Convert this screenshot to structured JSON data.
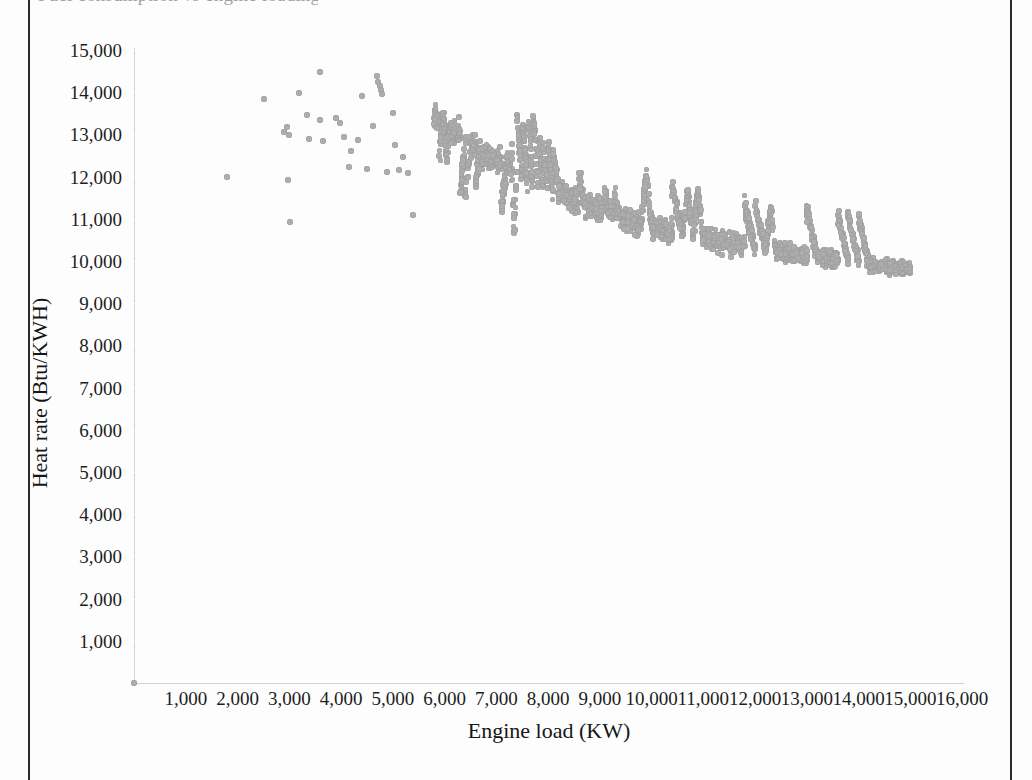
{
  "page": {
    "title_remnant": "Fuel consumption vs engine loading",
    "frame_color": "#2b2b2b",
    "background": "#ffffff"
  },
  "chart_data": {
    "type": "scatter",
    "title": "",
    "xlabel": "Engine load (KW)",
    "ylabel": "Heat rate (Btu/KWH)",
    "xlim": [
      0,
      16000
    ],
    "ylim": [
      0,
      15000
    ],
    "xticks": [
      "1,000",
      "2,000",
      "3,000",
      "4,000",
      "5,000",
      "6,000",
      "7,000",
      "8,000",
      "9,000",
      "10,000",
      "11,000",
      "12,000",
      "13,000",
      "14,000",
      "15,000",
      "16,000"
    ],
    "xtick_values": [
      1000,
      2000,
      3000,
      4000,
      5000,
      6000,
      7000,
      8000,
      9000,
      10000,
      11000,
      12000,
      13000,
      14000,
      15000,
      16000
    ],
    "yticks": [
      "1,000",
      "2,000",
      "3,000",
      "4,000",
      "5,000",
      "6,000",
      "7,000",
      "8,000",
      "9,000",
      "10,000",
      "11,000",
      "12,000",
      "13,000",
      "14,000",
      "15,000"
    ],
    "ytick_values": [
      1000,
      2000,
      3000,
      4000,
      5000,
      6000,
      7000,
      8000,
      9000,
      10000,
      11000,
      12000,
      13000,
      14000,
      15000
    ],
    "grid": "faint",
    "legend": "none",
    "marker_color": "#adadad",
    "marker_shape": "circle",
    "series": [
      {
        "name": "Engine operating points",
        "points": [
          [
            0,
            0
          ],
          [
            1800,
            11980
          ],
          [
            2520,
            13830
          ],
          [
            2900,
            13060
          ],
          [
            3000,
            12980
          ],
          [
            2960,
            13180
          ],
          [
            2980,
            11930
          ],
          [
            3020,
            10930
          ],
          [
            3180,
            13970
          ],
          [
            3350,
            13460
          ],
          [
            3380,
            12900
          ],
          [
            3600,
            14470
          ],
          [
            3600,
            13330
          ],
          [
            3650,
            12850
          ],
          [
            3900,
            13400
          ],
          [
            3980,
            13260
          ],
          [
            4050,
            12950
          ],
          [
            4150,
            12220
          ],
          [
            4200,
            12600
          ],
          [
            4320,
            12870
          ],
          [
            4400,
            13900
          ],
          [
            4500,
            12180
          ],
          [
            4620,
            13200
          ],
          [
            4700,
            14380
          ],
          [
            4720,
            14230
          ],
          [
            4760,
            14150
          ],
          [
            4780,
            14060
          ],
          [
            4800,
            13950
          ],
          [
            4880,
            12120
          ],
          [
            5000,
            13500
          ],
          [
            5050,
            12740
          ],
          [
            5120,
            12150
          ],
          [
            5300,
            12080
          ],
          [
            5400,
            11100
          ],
          [
            5200,
            12470
          ],
          [
            5800,
            13400
          ],
          [
            5850,
            13340
          ],
          [
            5900,
            13300
          ],
          [
            5950,
            13250
          ],
          [
            6000,
            13200
          ],
          [
            6100,
            13120
          ],
          [
            6200,
            13040
          ],
          [
            6300,
            12960
          ],
          [
            6400,
            12880
          ],
          [
            6500,
            12800
          ],
          [
            6600,
            12720
          ],
          [
            6700,
            12640
          ],
          [
            6800,
            12560
          ],
          [
            6900,
            12480
          ],
          [
            7000,
            12400
          ],
          [
            7100,
            12320
          ],
          [
            7200,
            12250
          ],
          [
            7300,
            12180
          ],
          [
            7400,
            12110
          ],
          [
            7500,
            12040
          ],
          [
            7600,
            11970
          ],
          [
            7700,
            11900
          ],
          [
            7800,
            11840
          ],
          [
            7900,
            11780
          ],
          [
            8000,
            11720
          ],
          [
            8100,
            11660
          ],
          [
            8200,
            11600
          ],
          [
            8300,
            11545
          ],
          [
            8400,
            11490
          ],
          [
            8500,
            11435
          ],
          [
            8600,
            11385
          ],
          [
            8700,
            11335
          ],
          [
            8800,
            11285
          ],
          [
            8900,
            11240
          ],
          [
            9000,
            11195
          ],
          [
            9200,
            11110
          ],
          [
            9400,
            11030
          ],
          [
            9600,
            10955
          ],
          [
            9800,
            10885
          ],
          [
            10000,
            10820
          ],
          [
            10200,
            10755
          ],
          [
            10400,
            10695
          ],
          [
            10600,
            10640
          ],
          [
            10800,
            10585
          ],
          [
            11000,
            10535
          ],
          [
            11200,
            10485
          ],
          [
            11400,
            10440
          ],
          [
            11600,
            10395
          ],
          [
            11800,
            10350
          ],
          [
            12000,
            10310
          ],
          [
            12200,
            10270
          ],
          [
            12400,
            10235
          ],
          [
            12600,
            10200
          ],
          [
            12800,
            10165
          ],
          [
            13000,
            10130
          ],
          [
            13200,
            10100
          ],
          [
            13400,
            10070
          ],
          [
            13600,
            10040
          ],
          [
            13800,
            10015
          ],
          [
            14000,
            9990
          ],
          [
            14200,
            9930
          ],
          [
            14400,
            9900
          ],
          [
            14600,
            9870
          ],
          [
            14800,
            9830
          ],
          [
            15000,
            9800
          ],
          [
            7400,
            13450
          ],
          [
            7500,
            13100
          ],
          [
            7520,
            13230
          ],
          [
            7600,
            13170
          ],
          [
            7650,
            13260
          ],
          [
            7700,
            13180
          ],
          [
            7750,
            13100
          ],
          [
            7800,
            12550
          ],
          [
            7850,
            12700
          ],
          [
            7900,
            12600
          ],
          [
            7300,
            12550
          ],
          [
            7350,
            10700
          ],
          [
            8000,
            12680
          ],
          [
            8100,
            12620
          ],
          [
            9900,
            12020
          ],
          [
            10400,
            11760
          ],
          [
            10700,
            11640
          ],
          [
            10900,
            11640
          ],
          [
            11800,
            11300
          ],
          [
            12000,
            11310
          ],
          [
            12300,
            11250
          ],
          [
            13000,
            11200
          ],
          [
            13600,
            11080
          ],
          [
            13800,
            11090
          ],
          [
            14000,
            11060
          ],
          [
            6300,
            11600
          ],
          [
            6400,
            11550
          ],
          [
            6600,
            11900
          ],
          [
            6450,
            12200
          ],
          [
            5900,
            12500
          ],
          [
            6050,
            12400
          ],
          [
            6700,
            12300
          ],
          [
            8600,
            11950
          ],
          [
            9100,
            11500
          ],
          [
            9300,
            11450
          ],
          [
            7100,
            11400
          ]
        ]
      }
    ]
  }
}
